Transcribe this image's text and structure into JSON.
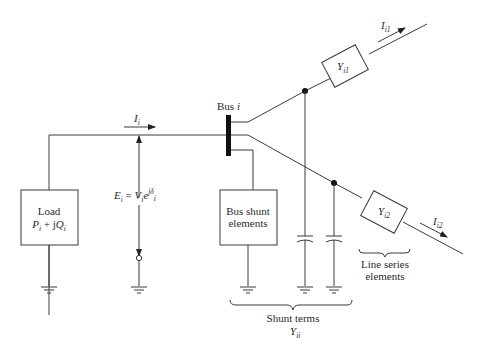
{
  "diagram": {
    "bus": {
      "label": "Bus ",
      "label_italic": "i"
    },
    "current_in": {
      "symbol": "I",
      "sub": "i"
    },
    "current_out1": {
      "symbol": "I",
      "sub": "i1"
    },
    "current_out2": {
      "symbol": "I",
      "sub": "i2"
    },
    "admittance1": {
      "symbol": "Y",
      "sub": "i1"
    },
    "admittance2": {
      "symbol": "Y",
      "sub": "i2"
    },
    "load": {
      "line1": "Load",
      "p": "P",
      "p_sub": "i",
      "plus_j": " + j",
      "q": "Q",
      "q_sub": "i"
    },
    "voltage": {
      "e": "E",
      "e_sub": "i",
      "eq": " = ",
      "v": "V",
      "v_sub": "i",
      "exp_base": "e",
      "exp": "jδ",
      "exp_sub": "i"
    },
    "bus_shunt": {
      "line1": "Bus shunt",
      "line2": "elements"
    },
    "line_series": {
      "line1": "Line series",
      "line2": "elements"
    },
    "shunt_terms": {
      "line1": "Shunt terms",
      "symbol": "Y",
      "sub": "ii"
    }
  }
}
